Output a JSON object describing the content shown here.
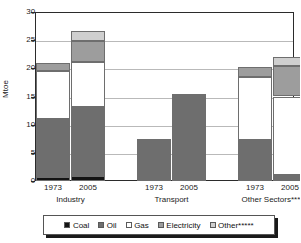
{
  "chart_data": {
    "type": "bar",
    "subtype": "stacked-grouped",
    "title": "",
    "xlabel": "",
    "ylabel": "Mtoe",
    "ylim": [
      0,
      30
    ],
    "yticks": [
      0,
      5,
      10,
      15,
      20,
      25,
      30
    ],
    "ytick_labels": [
      "0",
      "5",
      "10",
      "15",
      "20",
      "25",
      "30"
    ],
    "grid": true,
    "legend_position": "bottom",
    "categories": [
      "1973",
      "2005",
      "1973",
      "2005",
      "1973",
      "2005"
    ],
    "groups": [
      {
        "label": "Industry",
        "years": [
          "1973",
          "2005"
        ]
      },
      {
        "label": "Transport",
        "years": [
          "1973",
          "2005"
        ]
      },
      {
        "label": "Other Sectors****",
        "years": [
          "1973",
          "2005"
        ]
      }
    ],
    "series": [
      {
        "name": "Coal",
        "color": "#141414",
        "values": [
          0.7,
          0.8,
          0.0,
          0.0,
          0.4,
          0.0
        ]
      },
      {
        "name": "Oil",
        "color": "#6e6e6e",
        "values": [
          10.3,
          12.3,
          7.4,
          15.4,
          6.9,
          1.1
        ]
      },
      {
        "name": "Gas",
        "color": "#ffffff",
        "values": [
          8.5,
          8.1,
          0.0,
          0.0,
          11.1,
          13.9
        ]
      },
      {
        "name": "Electricity",
        "color": "#9d9d9d",
        "values": [
          1.5,
          3.6,
          0.0,
          0.0,
          1.8,
          5.5
        ]
      },
      {
        "name": "Other*****",
        "color": "#cfcfcf",
        "values": [
          0.0,
          1.9,
          0.0,
          0.0,
          0.0,
          1.6
        ]
      }
    ],
    "bar_totals": [
      21.0,
      26.7,
      7.4,
      15.4,
      20.2,
      22.1
    ],
    "legend": [
      {
        "label": "Coal",
        "color": "#141414"
      },
      {
        "label": "Oil",
        "color": "#6e6e6e"
      },
      {
        "label": "Gas",
        "color": "#ffffff"
      },
      {
        "label": "Electricity",
        "color": "#9d9d9d"
      },
      {
        "label": "Other*****",
        "color": "#cfcfcf"
      }
    ]
  }
}
